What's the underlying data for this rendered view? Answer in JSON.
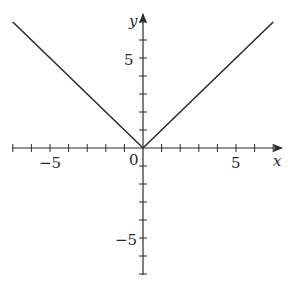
{
  "chart_data": {
    "type": "line",
    "title": "",
    "function": "y = |x|",
    "xlabel": "x",
    "ylabel": "y",
    "xlim": [
      -7.2,
      7.5
    ],
    "ylim": [
      -7.0,
      7.3
    ],
    "x_tick_step": 1,
    "y_tick_step": 1,
    "x_tick_labels": [
      {
        "value": -5,
        "label": "−5"
      },
      {
        "value": 5,
        "label": "5"
      }
    ],
    "y_tick_labels": [
      {
        "value": 5,
        "label": "5"
      },
      {
        "value": -5,
        "label": "−5"
      }
    ],
    "origin_label": "0",
    "grid": false,
    "legend": null,
    "series": [
      {
        "name": "|x|",
        "color": "#2b2b2b",
        "x": [
          -7,
          0,
          7
        ],
        "values": [
          7,
          0,
          7
        ]
      }
    ]
  },
  "labels": {
    "x_axis": "x",
    "y_axis": "y",
    "origin": "0",
    "x_neg5": "−5",
    "x_pos5": "5",
    "y_pos5": "5",
    "y_neg5": "−5"
  }
}
